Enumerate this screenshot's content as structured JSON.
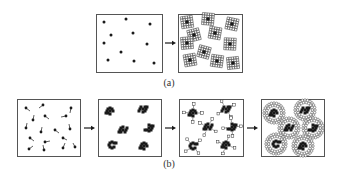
{
  "figure": {
    "row_a": {
      "caption": "(a)",
      "panels": [
        {
          "id": "a1",
          "description": "randomly distributed nuclei",
          "box": [
            96,
            14,
            66,
            58
          ],
          "nuclei": [
            [
              104,
              22
            ],
            [
              126,
              19
            ],
            [
              150,
              24
            ],
            [
              111,
              35
            ],
            [
              133,
              33
            ],
            [
              104,
              43
            ],
            [
              147,
              44
            ],
            [
              121,
              52
            ],
            [
              108,
              60
            ],
            [
              134,
              61
            ],
            [
              154,
              63
            ]
          ]
        },
        {
          "id": "a2",
          "description": "grains grown around each nucleus filling the space",
          "box": [
            178,
            14,
            64,
            58
          ],
          "grains": [
            [
              187,
              22,
              -8
            ],
            [
              208,
              19,
              5
            ],
            [
              232,
              24,
              12
            ],
            [
              194,
              35,
              -14
            ],
            [
              215,
              33,
              10
            ],
            [
              187,
              43,
              -5
            ],
            [
              230,
              44,
              3
            ],
            [
              204,
              52,
              15
            ],
            [
              190,
              60,
              -10
            ],
            [
              217,
              61,
              8
            ],
            [
              233,
              63,
              -6
            ]
          ]
        }
      ],
      "arrow": {
        "x1": 165,
        "x2": 176,
        "y": 43
      }
    },
    "row_b": {
      "caption": "(b)",
      "panels": [
        {
          "id": "b1",
          "description": "dispersed particles with tails (mobile units)",
          "box": [
            17,
            99,
            63,
            57
          ],
          "particles": [
            [
              26,
              108,
              4,
              3
            ],
            [
              43,
              105,
              -4,
              3
            ],
            [
              71,
              108,
              -1,
              5
            ],
            [
              33,
              120,
              1,
              -5
            ],
            [
              45,
              116,
              4,
              3
            ],
            [
              66,
              116,
              -5,
              1
            ],
            [
              26,
              128,
              1,
              -5
            ],
            [
              41,
              132,
              1,
              -5
            ],
            [
              55,
              130,
              4,
              3
            ],
            [
              70,
              129,
              -1,
              -5
            ],
            [
              30,
              138,
              4,
              3
            ],
            [
              45,
              142,
              5,
              -1
            ],
            [
              63,
              138,
              4,
              2
            ],
            [
              29,
              149,
              4,
              -3
            ],
            [
              44,
              150,
              -1,
              -5
            ],
            [
              63,
              148,
              2,
              -5
            ],
            [
              75,
              147,
              -2,
              -4
            ]
          ]
        },
        {
          "id": "b2",
          "description": "particles aggregated into dark clusters",
          "box": [
            98,
            99,
            63,
            57
          ],
          "clusters": [
            [
              110,
              111
            ],
            [
              143,
              109
            ],
            [
              123,
              130
            ],
            [
              149,
              128
            ],
            [
              112,
              145
            ],
            [
              144,
              146
            ]
          ]
        },
        {
          "id": "b3",
          "description": "clusters surrounded by small open units attaching",
          "box": [
            179,
            99,
            64,
            57
          ],
          "clusters": [
            [
              193,
              113
            ],
            [
              226,
              109
            ],
            [
              208,
              127
            ],
            [
              232,
              127
            ],
            [
              193,
              146
            ],
            [
              226,
              145
            ]
          ]
        },
        {
          "id": "b4",
          "description": "clusters enveloped by shells of open cells",
          "box": [
            261,
            99,
            63,
            57
          ],
          "clusters": [
            [
              274,
              113
            ],
            [
              305,
              110
            ],
            [
              289,
              128
            ],
            [
              313,
              128
            ],
            [
              276,
              144
            ],
            [
              303,
              146
            ]
          ]
        }
      ],
      "arrows": [
        {
          "x1": 84,
          "x2": 95,
          "y": 128
        },
        {
          "x1": 165,
          "x2": 176,
          "y": 128
        },
        {
          "x1": 247,
          "x2": 258,
          "y": 128
        }
      ]
    }
  },
  "colors": {
    "ink": "#1a1a1a",
    "frame": "#555555",
    "background": "#ffffff"
  }
}
